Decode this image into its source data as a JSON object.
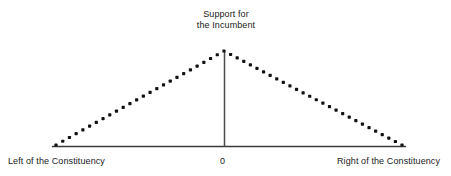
{
  "figure": {
    "name": "support-for-the-incumbent-tent-diagram",
    "background_color": "#ffffff",
    "line_color": "#333333",
    "dot_color": "#111111"
  },
  "title": {
    "line1": "Support for",
    "line2": "the Incumbent"
  },
  "axis_labels": {
    "left": "Left of the Constituency",
    "center": "0",
    "right": "Right of the Constituency"
  },
  "chart_data": {
    "type": "line",
    "title": "Support for the Incumbent",
    "xlabel": "",
    "ylabel": "Support for the Incumbent",
    "tick_labels": [
      "Left of the Constituency",
      "0",
      "Right of the Constituency"
    ],
    "grid": false,
    "legend": null,
    "xlim": [
      -1,
      1
    ],
    "ylim": [
      0,
      1
    ],
    "series": [
      {
        "name": "Support for the Incumbent",
        "style": "dotted",
        "x": [
          -1.0,
          -0.9,
          -0.8,
          -0.7,
          -0.6,
          -0.5,
          -0.4,
          -0.3,
          -0.2,
          -0.1,
          0.0,
          0.1,
          0.2,
          0.3,
          0.4,
          0.5,
          0.6,
          0.7,
          0.8,
          0.9,
          1.0
        ],
        "values": [
          0.0,
          0.1,
          0.2,
          0.3,
          0.4,
          0.5,
          0.6,
          0.7,
          0.8,
          0.9,
          1.0,
          0.9,
          0.8,
          0.7,
          0.6,
          0.5,
          0.4,
          0.3,
          0.2,
          0.1,
          0.0
        ]
      }
    ],
    "annotations": [
      {
        "text": "Support for the Incumbent",
        "x": 0.0,
        "y": 1.0
      }
    ]
  },
  "geometry": {
    "axis_y": 146,
    "axis_x_start": 52,
    "axis_x_end": 406,
    "peak_x": 224,
    "peak_y": 51,
    "left_foot_x": 56,
    "right_foot_x": 402,
    "dot_size": 3.2,
    "dot_step_px": 6.6
  }
}
